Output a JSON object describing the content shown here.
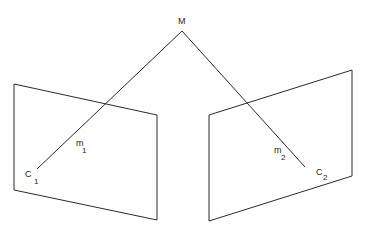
{
  "diagram": {
    "type": "stereo-epipolar-geometry",
    "point_label": "M",
    "left_image": {
      "projection": {
        "main": "m",
        "sub": "1"
      },
      "center": {
        "main": "C",
        "sub": "1"
      }
    },
    "right_image": {
      "projection": {
        "main": "m",
        "sub": "2"
      },
      "center": {
        "main": "C",
        "sub": "2"
      }
    },
    "colors": {
      "stroke": "#2a2a2a",
      "text": "#222222",
      "background": "#ffffff"
    }
  }
}
